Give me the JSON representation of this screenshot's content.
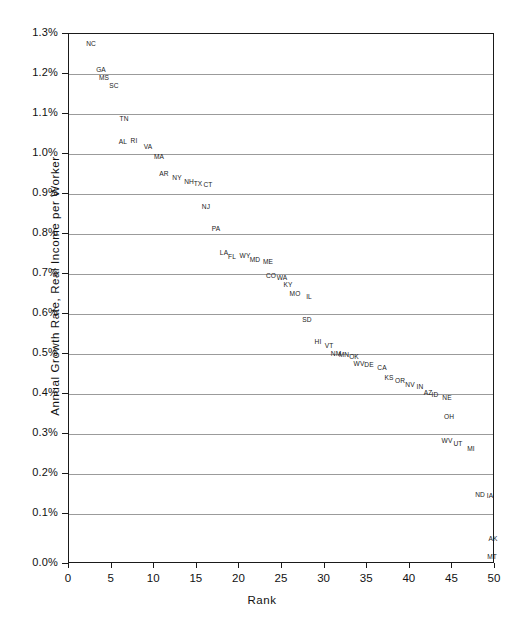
{
  "chart_data": {
    "type": "scatter",
    "title": "",
    "xlabel": "Rank",
    "ylabel": "Annual Growth Rate, Real Income per Worker",
    "xlim": [
      0,
      50
    ],
    "ylim": [
      0.0,
      1.3
    ],
    "xticks": [
      "0",
      "5",
      "10",
      "15",
      "20",
      "25",
      "30",
      "35",
      "40",
      "45",
      "50"
    ],
    "yticks": [
      "0.0%",
      "0.1%",
      "0.2%",
      "0.3%",
      "0.4%",
      "0.5%",
      "0.6%",
      "0.7%",
      "0.8%",
      "0.9%",
      "1.0%",
      "1.1%",
      "1.2%",
      "1.3%"
    ],
    "grid": "horizontal",
    "legend": "none",
    "point_style": "text-label",
    "points": [
      {
        "label": "NC",
        "x": 1,
        "y": 1.275
      },
      {
        "label": "GA",
        "x": 3,
        "y": 1.215
      },
      {
        "label": "MS",
        "x": 4,
        "y": 1.202
      },
      {
        "label": "SC",
        "x": 5,
        "y": 1.185
      },
      {
        "label": "TN",
        "x": 7,
        "y": 1.095
      },
      {
        "label": "AL",
        "x": 10,
        "y": 1.043
      },
      {
        "label": "RI",
        "x": 11,
        "y": 1.043
      },
      {
        "label": "VA",
        "x": 12,
        "y": 1.033
      },
      {
        "label": "MA",
        "x": 13,
        "y": 1.01
      },
      {
        "label": "AR",
        "x": 15,
        "y": 0.973
      },
      {
        "label": "NY",
        "x": 16,
        "y": 0.963
      },
      {
        "label": "NH",
        "x": 17,
        "y": 0.956
      },
      {
        "label": "TX",
        "x": 18,
        "y": 0.95
      },
      {
        "label": "CT",
        "x": 19,
        "y": 0.948
      },
      {
        "label": "NJ",
        "x": 19,
        "y": 0.893
      },
      {
        "label": "PA",
        "x": 21,
        "y": 0.838
      },
      {
        "label": "LA",
        "x": 23,
        "y": 0.772
      },
      {
        "label": "FL",
        "x": 24,
        "y": 0.762
      },
      {
        "label": "WY",
        "x": 25,
        "y": 0.762
      },
      {
        "label": "MD",
        "x": 26,
        "y": 0.752
      },
      {
        "label": "ME",
        "x": 27,
        "y": 0.748
      },
      {
        "label": "CO",
        "x": 29,
        "y": 0.712
      },
      {
        "label": "WA",
        "x": 30,
        "y": 0.71
      },
      {
        "label": "KY",
        "x": 31,
        "y": 0.693
      },
      {
        "label": "MO",
        "x": 32,
        "y": 0.678
      },
      {
        "label": "IL",
        "x": 33,
        "y": 0.673
      },
      {
        "label": "SD",
        "x": 35,
        "y": 0.612
      },
      {
        "label": "HI",
        "x": 37,
        "y": 0.537
      },
      {
        "label": "VT",
        "x": 38,
        "y": 0.531
      },
      {
        "label": "NM",
        "x": 40,
        "y": 0.513
      },
      {
        "label": "MN",
        "x": 41,
        "y": 0.511
      },
      {
        "label": "OK",
        "x": 42,
        "y": 0.508
      },
      {
        "label": "WV",
        "x": 42,
        "y": 0.497
      },
      {
        "label": "DE",
        "x": 43,
        "y": 0.495
      },
      {
        "label": "CA",
        "x": 44,
        "y": 0.49
      },
      {
        "label": "KS",
        "x": 45,
        "y": 0.466
      },
      {
        "label": "OR",
        "x": 46,
        "y": 0.461
      },
      {
        "label": "NV",
        "x": 47,
        "y": 0.452
      },
      {
        "label": "IN",
        "x": 48,
        "y": 0.448
      },
      {
        "label": "AZ",
        "x": 49,
        "y": 0.436
      },
      {
        "label": "ID",
        "x": 50,
        "y": 0.43
      },
      {
        "label": "NE",
        "x": 51,
        "y": 0.423
      },
      {
        "label": "OH",
        "x": 53,
        "y": 0.375
      },
      {
        "label": "WV2",
        "x": 55,
        "y": 0.318
      },
      {
        "label": "UT",
        "x": 56,
        "y": 0.311
      },
      {
        "label": "MI",
        "x": 57,
        "y": 0.3
      },
      {
        "label": "ND",
        "x": 59,
        "y": 0.198
      },
      {
        "label": "IA",
        "x": 60,
        "y": 0.196
      },
      {
        "label": "AK",
        "x": 61,
        "y": 0.062
      },
      {
        "label": "MT",
        "x": 62,
        "y": 0.018
      }
    ],
    "plotted": [
      {
        "label": "NC",
        "px": 90,
        "py": 42
      },
      {
        "label": "GA",
        "px": 100,
        "py": 68
      },
      {
        "label": "MS",
        "px": 103,
        "py": 76
      },
      {
        "label": "SC",
        "px": 113,
        "py": 84
      },
      {
        "label": "TN",
        "px": 123,
        "py": 117
      },
      {
        "label": "AL",
        "px": 122,
        "py": 140
      },
      {
        "label": "RI",
        "px": 133,
        "py": 139
      },
      {
        "label": "VA",
        "px": 147,
        "py": 145
      },
      {
        "label": "MA",
        "px": 158,
        "py": 155
      },
      {
        "label": "AR",
        "px": 163,
        "py": 172
      },
      {
        "label": "NY",
        "px": 176,
        "py": 176
      },
      {
        "label": "NH",
        "px": 188,
        "py": 180
      },
      {
        "label": "TX",
        "px": 197,
        "py": 182
      },
      {
        "label": "CT",
        "px": 207,
        "py": 183
      },
      {
        "label": "NJ",
        "px": 205,
        "py": 205
      },
      {
        "label": "PA",
        "px": 215,
        "py": 227
      },
      {
        "label": "LA",
        "px": 223,
        "py": 251
      },
      {
        "label": "FL",
        "px": 231,
        "py": 255
      },
      {
        "label": "WY",
        "px": 244,
        "py": 254
      },
      {
        "label": "MD",
        "px": 254,
        "py": 258
      },
      {
        "label": "ME",
        "px": 267,
        "py": 260
      },
      {
        "label": "CO",
        "px": 270,
        "py": 274
      },
      {
        "label": "WA",
        "px": 281,
        "py": 276
      },
      {
        "label": "KY",
        "px": 287,
        "py": 283
      },
      {
        "label": "MO",
        "px": 294,
        "py": 292
      },
      {
        "label": "IL",
        "px": 308,
        "py": 295
      },
      {
        "label": "SD",
        "px": 306,
        "py": 318
      },
      {
        "label": "HI",
        "px": 317,
        "py": 340
      },
      {
        "label": "VT",
        "px": 328,
        "py": 344
      },
      {
        "label": "NM",
        "px": 335,
        "py": 352
      },
      {
        "label": "MN",
        "px": 343,
        "py": 353
      },
      {
        "label": "OK",
        "px": 353,
        "py": 355
      },
      {
        "label": "WV2",
        "px": 358,
        "py": 362
      },
      {
        "label": "DE",
        "px": 368,
        "py": 363
      },
      {
        "label": "CA",
        "px": 381,
        "py": 366
      },
      {
        "label": "KS",
        "px": 388,
        "py": 376
      },
      {
        "label": "OR",
        "px": 399,
        "py": 379
      },
      {
        "label": "NV",
        "px": 409,
        "py": 383
      },
      {
        "label": "IN",
        "px": 419,
        "py": 385
      },
      {
        "label": "AZ",
        "px": 427,
        "py": 391
      },
      {
        "label": "ID",
        "px": 434,
        "py": 393
      },
      {
        "label": "NE",
        "px": 446,
        "py": 396
      },
      {
        "label": "OH",
        "px": 448,
        "py": 415
      },
      {
        "label": "WV",
        "px": 446,
        "py": 439
      },
      {
        "label": "UT",
        "px": 457,
        "py": 442
      },
      {
        "label": "MI",
        "px": 470,
        "py": 447
      },
      {
        "label": "ND",
        "px": 479,
        "py": 493
      },
      {
        "label": "IA",
        "px": 489,
        "py": 494
      },
      {
        "label": "AK",
        "px": 492,
        "py": 537
      },
      {
        "label": "MT",
        "px": 491,
        "py": 555
      }
    ],
    "gridline_py": [
      73,
      113,
      153,
      193,
      233,
      273,
      313,
      353,
      393,
      433,
      473,
      513
    ],
    "ytick_py": [
      33,
      73,
      113,
      153,
      193,
      233,
      273,
      313,
      353,
      393,
      433,
      473,
      513,
      563
    ],
    "xtick_px": [
      68,
      110.6,
      153.2,
      195.8,
      238.4,
      281,
      323.6,
      366.2,
      408.8,
      451.4,
      494
    ]
  }
}
